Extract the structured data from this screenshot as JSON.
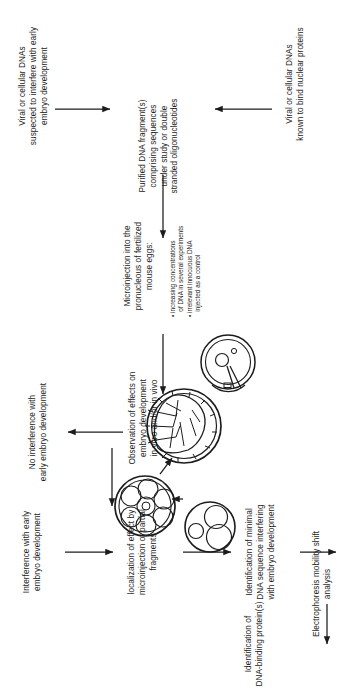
{
  "figure": {
    "background_color": "#ffffff",
    "ink_color": "#1c1c1c"
  },
  "nodes": [
    {
      "id": "viral-cellular-dnas-suspected",
      "text": "Viral or cellular DNAs\nsuspected to interfere with early\nembryo development"
    },
    {
      "id": "purified-dna-fragments",
      "text": "Purified DNA fragment(s)\ncomprising sequences\nunder study or double\nstranded oligonucleotides"
    },
    {
      "id": "viral-cellular-dnas-known",
      "text": "Viral or cellular DNAs\nknown to bind nuclear proteins"
    },
    {
      "id": "microinjection",
      "text": "Microinjection into the\npronucleous of fertilized\nmouse eggs:"
    },
    {
      "id": "observation-of-effects",
      "text": "Observation of effects on\nembryo development\nin vitro and/or in vivo"
    },
    {
      "id": "no-interference",
      "text": "No interference with\nearly embryo development"
    },
    {
      "id": "interference",
      "text": "Interference with early\nembryo development"
    },
    {
      "id": "localization-of-effect",
      "text": "localization of effect by\nmicroinjection of partial\nfragments"
    },
    {
      "id": "identification-minimal-dna",
      "text": "Identification of minimal\nDNA sequence interfering\nwith embryo development"
    },
    {
      "id": "electrophoresis",
      "text": "Electrophoresis mobility shift\nanalysis"
    },
    {
      "id": "identification-dna-binding",
      "text": "Identification of\nDNA-binding protein(s)"
    }
  ],
  "bullets": {
    "id": "microinjection-bullets",
    "lines": [
      "• increasing concentrations",
      "   of DNA in several experiments",
      "• irrelevant innocuous DNA",
      "   injected as a control"
    ]
  },
  "illustrations": [
    {
      "id": "fertilized-egg-with-pipette",
      "label": "fertilized mouse egg being microinjected with a pipette"
    },
    {
      "id": "early-cleavage-embryo",
      "label": "two-to-three cell cleavage stage embryo with shaded nucleus"
    },
    {
      "id": "morula-embryo",
      "label": "morula, multicellular cleavage-stage embryo"
    },
    {
      "id": "blastocyst-embryo",
      "label": "blastocyst with inner cell mass and blastocoel cavity"
    }
  ],
  "arrows": [
    {
      "id": "arrow-suspected-to-purified",
      "direction": "right"
    },
    {
      "id": "arrow-known-to-purified",
      "direction": "left"
    },
    {
      "id": "arrow-purified-to-microinjection",
      "direction": "up"
    },
    {
      "id": "arrow-microinjection-to-observation",
      "direction": "up"
    },
    {
      "id": "arrow-observation-to-no-interference",
      "direction": "left"
    },
    {
      "id": "arrow-observation-to-interference",
      "direction": "up"
    },
    {
      "id": "arrow-interference-to-localization",
      "direction": "right"
    },
    {
      "id": "arrow-localization-to-identification",
      "direction": "right"
    },
    {
      "id": "arrow-identification-to-electrophoresis",
      "direction": "right"
    },
    {
      "id": "arrow-electrophoresis-to-protein",
      "direction": "down"
    },
    {
      "id": "arrow-cleavage-to-morula",
      "direction": "up"
    },
    {
      "id": "arrow-morula-to-blastocyst",
      "direction": "right"
    }
  ]
}
